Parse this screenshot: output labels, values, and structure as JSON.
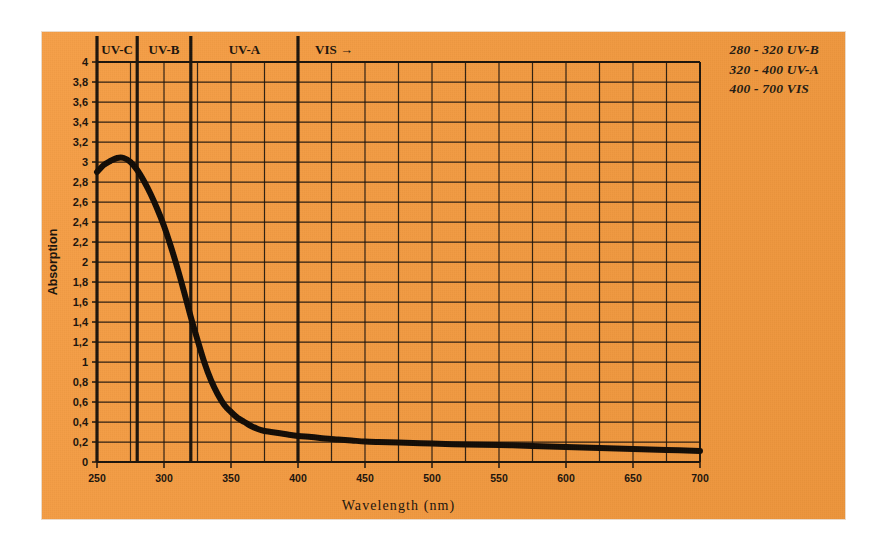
{
  "figure": {
    "panel_color": "#f59a3e",
    "ink_color": "#1c140c",
    "background": "#ffffff"
  },
  "legend": {
    "lines": [
      "280 - 320 UV-B",
      "320 - 400 UV-A",
      "400 - 700 VIS"
    ]
  },
  "bands": [
    {
      "label": "UV-C",
      "start": 250,
      "end": 280
    },
    {
      "label": "UV-B",
      "start": 280,
      "end": 320
    },
    {
      "label": "UV-A",
      "start": 320,
      "end": 400
    },
    {
      "label": "VIS →",
      "start": 400,
      "end": 700
    }
  ],
  "chart_data": {
    "type": "line",
    "title": "",
    "xlabel": "Wavelength (nm)",
    "ylabel": "Absorption",
    "xlim": [
      250,
      700
    ],
    "ylim": [
      0,
      4
    ],
    "grid": true,
    "grid_x_step": 25,
    "grid_y_step": 0.2,
    "legend_position": "top-right",
    "xticks": [
      250,
      300,
      350,
      400,
      450,
      500,
      550,
      600,
      650,
      700
    ],
    "xtick_labels": [
      "250",
      "300",
      "350",
      "400",
      "450",
      "500",
      "550",
      "600",
      "650",
      "700"
    ],
    "yticks": [
      0,
      0.2,
      0.4,
      0.6,
      0.8,
      1,
      1.2,
      1.4,
      1.6,
      1.8,
      2,
      2.2,
      2.4,
      2.6,
      2.8,
      3,
      3.2,
      3.4,
      3.6,
      3.8,
      4
    ],
    "ytick_labels": [
      "0",
      "0,2",
      "0,4",
      "0,6",
      "0,8",
      "1",
      "1,2",
      "1,4",
      "1,6",
      "1,8",
      "2",
      "2,2",
      "2,4",
      "2,6",
      "2,8",
      "3",
      "3,2",
      "3,4",
      "3,6",
      "3,8",
      "4"
    ],
    "band_dividers": [
      280,
      320,
      400
    ],
    "series": [
      {
        "name": "Absorption",
        "color": "#120c06",
        "linewidth": 6,
        "x": [
          250,
          255,
          260,
          265,
          270,
          275,
          280,
          285,
          290,
          295,
          300,
          305,
          310,
          315,
          320,
          325,
          330,
          335,
          340,
          345,
          350,
          355,
          360,
          365,
          370,
          375,
          380,
          390,
          400,
          410,
          420,
          430,
          440,
          450,
          460,
          475,
          500,
          525,
          550,
          575,
          600,
          625,
          650,
          675,
          700
        ],
        "y": [
          2.9,
          2.97,
          3.01,
          3.04,
          3.04,
          3.0,
          2.92,
          2.81,
          2.68,
          2.53,
          2.36,
          2.16,
          1.94,
          1.7,
          1.45,
          1.22,
          1.0,
          0.82,
          0.68,
          0.57,
          0.5,
          0.44,
          0.4,
          0.36,
          0.33,
          0.31,
          0.3,
          0.28,
          0.26,
          0.25,
          0.235,
          0.225,
          0.215,
          0.205,
          0.2,
          0.195,
          0.185,
          0.175,
          0.17,
          0.16,
          0.15,
          0.14,
          0.13,
          0.12,
          0.11
        ]
      }
    ]
  }
}
